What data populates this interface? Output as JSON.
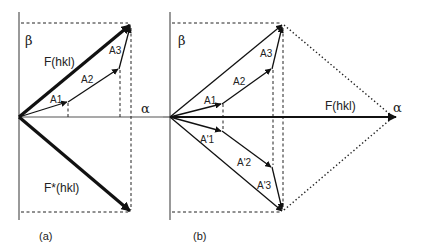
{
  "figure": {
    "panel_a": {
      "caption": "(a)",
      "axis_alpha": "α",
      "axis_beta": "β",
      "vector_F": "F(hkl)",
      "vector_Fstar": "F*(hkl)",
      "components": [
        "A1",
        "A2",
        "A3"
      ]
    },
    "panel_b": {
      "caption": "(b)",
      "axis_alpha": "α",
      "axis_beta": "β",
      "vector_F": "F(hkl)",
      "components_upper": [
        "A1",
        "A2",
        "A3"
      ],
      "components_lower": [
        "A'1",
        "A'2",
        "A'3"
      ]
    },
    "colors": {
      "ink": "#111111",
      "axis": "#555555",
      "background": "#ffffff"
    }
  }
}
